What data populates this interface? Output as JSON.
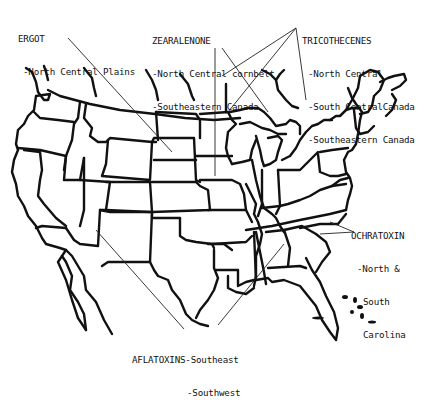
{
  "figure": {
    "type": "map",
    "region": "United States (contiguous) with southern Canada and northern Mexico outlines",
    "colors": {
      "ink": "#111111",
      "background": "#ffffff"
    }
  },
  "labels": {
    "ergot": {
      "title": "ERGOT",
      "regions": [
        "-North Central Plains"
      ]
    },
    "zearalenone": {
      "title": "ZEARALENONE",
      "regions": [
        "-North Central cornbelt",
        "-Southeastern Canada"
      ]
    },
    "tricothecenes": {
      "title": "TRICOTHECENES",
      "regions": [
        "-North Central",
        "-South CentralCanada",
        "-Southeastern Canada"
      ]
    },
    "ochratoxin": {
      "title": "OCHRATOXIN",
      "regions": [
        "-North &",
        "South",
        "Carolina"
      ]
    },
    "aflatoxins": {
      "title": "AFLATOXINS-Southeast",
      "regions": [
        "-Southwest"
      ]
    }
  }
}
